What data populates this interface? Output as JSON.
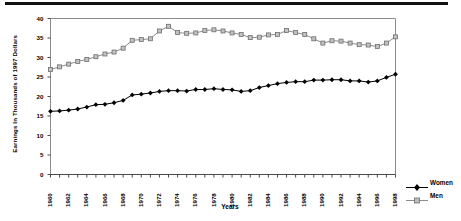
{
  "chart_data": {
    "type": "line",
    "title": "",
    "xlabel": "Years",
    "ylabel": "Earnings In Thousands of 1997 Dollars",
    "x": [
      1960,
      1961,
      1962,
      1963,
      1964,
      1965,
      1966,
      1967,
      1968,
      1969,
      1970,
      1971,
      1972,
      1973,
      1974,
      1975,
      1976,
      1977,
      1978,
      1979,
      1980,
      1981,
      1982,
      1983,
      1984,
      1985,
      1986,
      1987,
      1988,
      1989,
      1990,
      1991,
      1992,
      1993,
      1994,
      1995,
      1996,
      1997,
      1998
    ],
    "xtick_labels": [
      "1960",
      "1962",
      "1964",
      "1966",
      "1968",
      "1970",
      "1972",
      "1974",
      "1976",
      "1978",
      "1980",
      "1982",
      "1984",
      "1986",
      "1988",
      "1990",
      "1992",
      "1994",
      "1996",
      "1998"
    ],
    "ytick_labels": [
      "0",
      "5",
      "10",
      "15",
      "20",
      "25",
      "30",
      "35",
      "40"
    ],
    "yticks": [
      0,
      5,
      10,
      15,
      20,
      25,
      30,
      35,
      40
    ],
    "ylim": [
      0,
      40
    ],
    "xlim": [
      1960,
      1998
    ],
    "grid": false,
    "legend_position": "right",
    "series": [
      {
        "name": "Women",
        "color": "#000000",
        "marker": "diamond",
        "values": [
          16.2,
          16.3,
          16.5,
          16.8,
          17.3,
          17.9,
          18.0,
          18.4,
          19.0,
          20.4,
          20.6,
          20.9,
          21.3,
          21.5,
          21.5,
          21.4,
          21.8,
          21.8,
          22.0,
          21.8,
          21.7,
          21.3,
          21.5,
          22.3,
          22.8,
          23.3,
          23.6,
          23.8,
          23.8,
          24.2,
          24.2,
          24.3,
          24.3,
          24.0,
          24.0,
          23.7,
          24.0,
          24.9,
          25.7
        ]
      },
      {
        "name": "Men",
        "color": "#8c8c8c",
        "marker": "square",
        "values": [
          26.9,
          27.6,
          28.3,
          29.0,
          29.5,
          30.2,
          30.9,
          31.4,
          32.4,
          34.4,
          34.6,
          34.8,
          36.8,
          38.0,
          36.4,
          36.2,
          36.3,
          36.9,
          37.1,
          36.8,
          36.3,
          35.9,
          35.1,
          35.2,
          35.8,
          35.9,
          36.9,
          36.4,
          35.9,
          34.8,
          33.7,
          34.3,
          34.2,
          33.7,
          33.3,
          33.2,
          32.8,
          33.7,
          35.3
        ]
      }
    ]
  },
  "legend": {
    "items": [
      {
        "label": "Women"
      },
      {
        "label": "Men"
      }
    ]
  }
}
